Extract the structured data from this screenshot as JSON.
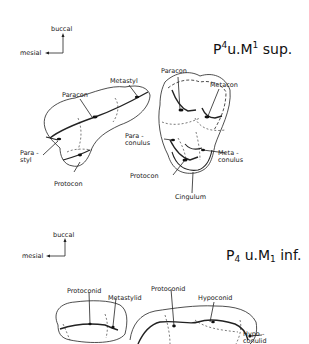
{
  "upper": {
    "title_base": "P",
    "title_sup1": "4",
    "title_mid": "u.M",
    "title_sup2": "1",
    "title_end": " sup.",
    "orientation": {
      "up": "buccal",
      "left": "mesial"
    },
    "labels": {
      "metastyl": "Metastyl",
      "paracon_p4": "Paracon",
      "parastyl_1": "Para -",
      "parastyl_2": "styl",
      "protocon_p4": "Protocon",
      "paracon_m1": "Paracon",
      "metacon": "Metacon",
      "paraconulus_1": "Para -",
      "paraconulus_2": "conulus",
      "metaconulus_1": "Meta -",
      "metaconulus_2": "conulus",
      "protocon_m1": "Protocon",
      "cingulum": "Cingulum"
    }
  },
  "lower": {
    "title_base": "P",
    "title_sub1": "4",
    "title_mid": " u.M",
    "title_sub2": "1",
    "title_end": " inf.",
    "orientation": {
      "up": "buccal",
      "left": "mesial"
    },
    "labels": {
      "protoconid_p4": "Protoconid",
      "metastylid": "Metastylid",
      "protoconid_m1": "Protoconid",
      "hypoconid": "Hypoconid",
      "hypoconulid_1": "Hypo -",
      "hypoconulid_2": "conulid"
    }
  }
}
